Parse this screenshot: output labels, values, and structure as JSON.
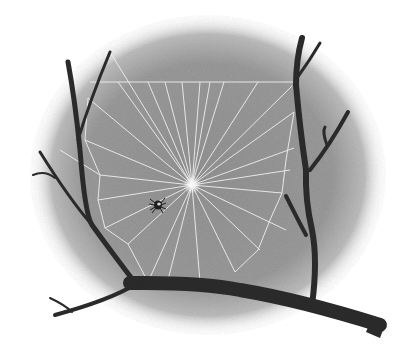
{
  "scene": {
    "subject": "Spider web strung between forked tree branches with a small spider",
    "colors": {
      "background": "#ffffff",
      "mist": "#8e8e8e",
      "mist_light": "#b5b5b5",
      "branch": "#2b2b2b",
      "silk": "#f2f2f2",
      "hub_glow": "#ffffff",
      "spider": "#1e1e1e"
    },
    "web": {
      "hub": [
        192,
        185
      ],
      "top_thread_y": 82
    },
    "spider": {
      "position": [
        158,
        205
      ]
    }
  }
}
